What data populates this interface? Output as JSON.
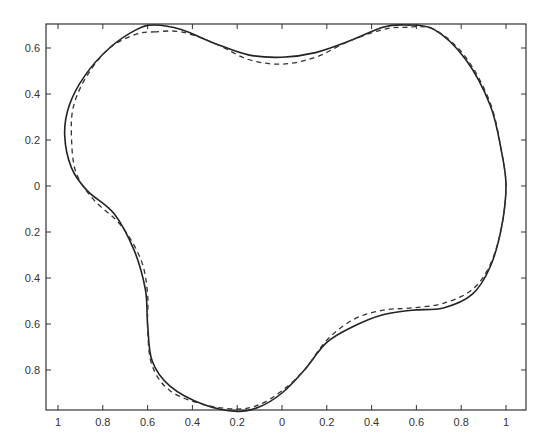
{
  "chart_data": {
    "type": "line",
    "title": "",
    "xlabel": "",
    "ylabel": "",
    "xlim": [
      -1.1,
      1.1
    ],
    "ylim": [
      -1.0,
      0.7
    ],
    "grid": false,
    "legend": null,
    "x_ticks": [
      "1",
      "0.8",
      "0.6",
      "0.4",
      "0.2",
      "0",
      "0.2",
      "0.4",
      "0.6",
      "0.8",
      "1"
    ],
    "x_tick_values": [
      -1,
      -0.8,
      -0.6,
      -0.4,
      -0.2,
      0,
      0.2,
      0.4,
      0.6,
      0.8,
      1
    ],
    "y_ticks": [
      "0.6",
      "0.4",
      "0.2",
      "0",
      "0.2",
      "0.4",
      "0.6",
      "0.8"
    ],
    "y_tick_values": [
      0.6,
      0.4,
      0.2,
      0,
      -0.2,
      -0.4,
      -0.6,
      -0.8
    ],
    "series": [
      {
        "name": "solid curve",
        "style": "solid",
        "color": "#222222",
        "points": [
          [
            -0.57,
            0.7
          ],
          [
            -0.45,
            0.68
          ],
          [
            -0.3,
            0.62
          ],
          [
            -0.15,
            0.57
          ],
          [
            0.0,
            0.56
          ],
          [
            0.15,
            0.58
          ],
          [
            0.3,
            0.63
          ],
          [
            0.45,
            0.69
          ],
          [
            0.55,
            0.7
          ],
          [
            0.68,
            0.68
          ],
          [
            0.82,
            0.55
          ],
          [
            0.93,
            0.35
          ],
          [
            0.98,
            0.15
          ],
          [
            1.0,
            0.0
          ],
          [
            0.98,
            -0.18
          ],
          [
            0.93,
            -0.35
          ],
          [
            0.85,
            -0.47
          ],
          [
            0.72,
            -0.53
          ],
          [
            0.58,
            -0.54
          ],
          [
            0.45,
            -0.56
          ],
          [
            0.32,
            -0.61
          ],
          [
            0.2,
            -0.68
          ],
          [
            0.1,
            -0.8
          ],
          [
            0.0,
            -0.9
          ],
          [
            -0.1,
            -0.96
          ],
          [
            -0.2,
            -0.98
          ],
          [
            -0.35,
            -0.95
          ],
          [
            -0.5,
            -0.87
          ],
          [
            -0.58,
            -0.76
          ],
          [
            -0.6,
            -0.6
          ],
          [
            -0.61,
            -0.45
          ],
          [
            -0.66,
            -0.28
          ],
          [
            -0.75,
            -0.12
          ],
          [
            -0.87,
            -0.02
          ],
          [
            -0.94,
            0.08
          ],
          [
            -0.97,
            0.22
          ],
          [
            -0.95,
            0.35
          ],
          [
            -0.88,
            0.48
          ],
          [
            -0.77,
            0.6
          ],
          [
            -0.65,
            0.68
          ],
          [
            -0.57,
            0.7
          ]
        ]
      },
      {
        "name": "dashed curve",
        "style": "dashed",
        "color": "#333333",
        "points": [
          [
            -0.57,
            0.67
          ],
          [
            -0.45,
            0.67
          ],
          [
            -0.3,
            0.62
          ],
          [
            -0.15,
            0.55
          ],
          [
            0.0,
            0.53
          ],
          [
            0.15,
            0.56
          ],
          [
            0.3,
            0.63
          ],
          [
            0.45,
            0.68
          ],
          [
            0.55,
            0.69
          ],
          [
            0.68,
            0.68
          ],
          [
            0.82,
            0.56
          ],
          [
            0.93,
            0.36
          ],
          [
            0.98,
            0.15
          ],
          [
            1.0,
            0.0
          ],
          [
            0.98,
            -0.18
          ],
          [
            0.93,
            -0.34
          ],
          [
            0.85,
            -0.45
          ],
          [
            0.72,
            -0.51
          ],
          [
            0.58,
            -0.53
          ],
          [
            0.45,
            -0.54
          ],
          [
            0.32,
            -0.58
          ],
          [
            0.2,
            -0.67
          ],
          [
            0.1,
            -0.8
          ],
          [
            0.0,
            -0.89
          ],
          [
            -0.1,
            -0.95
          ],
          [
            -0.2,
            -0.97
          ],
          [
            -0.35,
            -0.95
          ],
          [
            -0.5,
            -0.89
          ],
          [
            -0.58,
            -0.78
          ],
          [
            -0.6,
            -0.62
          ],
          [
            -0.6,
            -0.47
          ],
          [
            -0.63,
            -0.32
          ],
          [
            -0.72,
            -0.17
          ],
          [
            -0.84,
            -0.06
          ],
          [
            -0.92,
            0.06
          ],
          [
            -0.94,
            0.22
          ],
          [
            -0.93,
            0.35
          ],
          [
            -0.87,
            0.48
          ],
          [
            -0.77,
            0.6
          ],
          [
            -0.65,
            0.66
          ],
          [
            -0.57,
            0.67
          ]
        ]
      }
    ]
  }
}
